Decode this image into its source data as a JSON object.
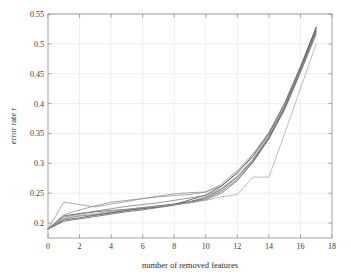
{
  "chart_data": {
    "type": "line",
    "title": "",
    "xlabel": "number of removed features",
    "ylabel": "error rate r",
    "xlim": [
      0,
      18
    ],
    "ylim": [
      0.175,
      0.55
    ],
    "xticks": [
      0,
      2,
      4,
      6,
      8,
      10,
      12,
      14,
      16,
      18
    ],
    "xtick_labels": [
      "0",
      "2",
      "4",
      "6",
      "8",
      "10",
      "12",
      "14",
      "16",
      "18"
    ],
    "yticks": [
      0.2,
      0.25,
      0.3,
      0.35,
      0.4,
      0.45,
      0.5,
      0.55
    ],
    "ytick_labels": [
      "0.2",
      "0.25",
      "0.3",
      "0.35",
      "0.4",
      "0.45",
      "0.5",
      "0.55"
    ],
    "grid": true,
    "legend": "none",
    "line_color": "#555555",
    "grid_color": "#e8e8e8",
    "axis_color": "#999999",
    "x": [
      0,
      1,
      2,
      3,
      4,
      5,
      6,
      7,
      8,
      9,
      10,
      11,
      12,
      13,
      14,
      15,
      16,
      17
    ],
    "series": [
      {
        "name": "run-1",
        "values": [
          0.19,
          0.212,
          0.216,
          0.219,
          0.221,
          0.223,
          0.226,
          0.229,
          0.232,
          0.236,
          0.243,
          0.256,
          0.277,
          0.305,
          0.343,
          0.395,
          0.458,
          0.527
        ]
      },
      {
        "name": "run-2",
        "values": [
          0.19,
          0.235,
          0.231,
          0.227,
          0.232,
          0.236,
          0.241,
          0.245,
          0.249,
          0.251,
          0.252,
          0.262,
          0.283,
          0.311,
          0.348,
          0.398,
          0.459,
          0.523
        ]
      },
      {
        "name": "run-3",
        "values": [
          0.19,
          0.207,
          0.212,
          0.214,
          0.218,
          0.222,
          0.225,
          0.228,
          0.231,
          0.234,
          0.239,
          0.25,
          0.271,
          0.302,
          0.342,
          0.392,
          0.455,
          0.521
        ]
      },
      {
        "name": "run-4",
        "values": [
          0.19,
          0.205,
          0.209,
          0.213,
          0.217,
          0.221,
          0.224,
          0.227,
          0.231,
          0.239,
          0.247,
          0.262,
          0.285,
          0.313,
          0.35,
          0.401,
          0.462,
          0.528
        ]
      },
      {
        "name": "run-5",
        "values": [
          0.19,
          0.214,
          0.222,
          0.229,
          0.235,
          0.238,
          0.241,
          0.244,
          0.246,
          0.248,
          0.252,
          0.265,
          0.288,
          0.316,
          0.352,
          0.4,
          0.458,
          0.519
        ]
      },
      {
        "name": "run-6",
        "values": [
          0.19,
          0.203,
          0.207,
          0.211,
          0.215,
          0.219,
          0.222,
          0.226,
          0.23,
          0.235,
          0.241,
          0.253,
          0.273,
          0.303,
          0.341,
          0.39,
          0.452,
          0.516
        ]
      },
      {
        "name": "run-7",
        "values": [
          0.19,
          0.21,
          0.215,
          0.22,
          0.224,
          0.228,
          0.231,
          0.234,
          0.238,
          0.242,
          0.246,
          0.258,
          0.278,
          0.307,
          0.345,
          0.394,
          0.455,
          0.524
        ]
      },
      {
        "name": "run-8-outlier",
        "values": [
          0.19,
          0.208,
          0.213,
          0.216,
          0.22,
          0.223,
          0.226,
          0.228,
          0.231,
          0.234,
          0.238,
          0.244,
          0.248,
          0.277,
          0.277,
          0.35,
          0.425,
          0.5
        ]
      }
    ]
  }
}
